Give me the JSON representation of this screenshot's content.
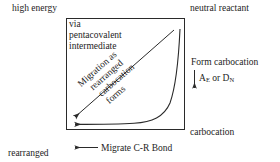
{
  "diagram": {
    "title_corners": {
      "top_left": "high energy",
      "top_right": "neutral reactant",
      "bottom_left_line1": "rearranged",
      "bottom_left_line2": "carbocation",
      "bottom_left_line3": "product",
      "bottom_right": "carbocation"
    },
    "inner_note": {
      "line1": "via",
      "line2": "pentacovalent",
      "line3": "intermediate"
    },
    "right_side": {
      "form_carbocation": "Form carbocation",
      "mechanism_prefix": "A",
      "mechanism_sub1": "E",
      "mechanism_middle": " or D",
      "mechanism_sub2": "N",
      "mechanism_full": "AE or DN"
    },
    "bottom_arrow_label": "Migrate C-R Bond",
    "diagonal_label": {
      "line1": "Migration as",
      "line2": "rearranged",
      "line3": "carbocation",
      "line4": "forms"
    },
    "colors": {
      "stroke": "#2a2a2a",
      "text": "#1d1d1d",
      "background": "#ffffff"
    }
  }
}
